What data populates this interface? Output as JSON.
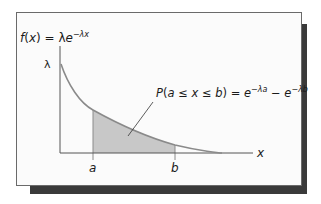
{
  "diagram": {
    "function_label": "f(x) = λe",
    "function_exponent": "−λx",
    "y_intercept_label": "λ",
    "x_axis_label": "x",
    "lower_bound_label": "a",
    "upper_bound_label": "b",
    "probability_label": "P(a ≤ x ≤ b) = e",
    "probability_exp_a": "−λa",
    "probability_minus": " − e",
    "probability_exp_b": "−λb",
    "colors": {
      "curve": "#8a8a8a",
      "shaded_area": "#c8c8c8",
      "axes": "#555555",
      "shadow": "#3a3a3a",
      "card_bg": "#fbfbfb"
    }
  }
}
